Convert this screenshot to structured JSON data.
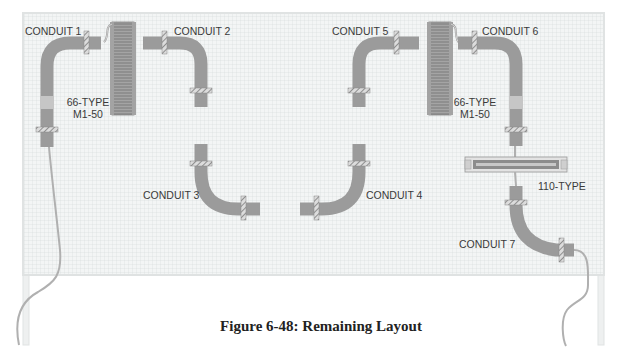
{
  "figure": {
    "caption": "Figure 6-48:  Remaining Layout"
  },
  "colors": {
    "board_fill": "#f1f3f3",
    "grid_line": "#d6dadb",
    "board_frame": "#e3e6e6",
    "conduit": "#9b9b9b",
    "conduit_sleeve": "#c4c4c4",
    "cable": "#b5b5b5",
    "block": "#8e8e8e",
    "label_text": "#3a3a3a"
  },
  "labels": {
    "conduit1": "CONDUIT 1",
    "conduit2": "CONDUIT 2",
    "conduit3": "CONDUIT 3",
    "conduit4": "CONDUIT 4",
    "conduit5": "CONDUIT 5",
    "conduit6": "CONDUIT 6",
    "conduit7": "CONDUIT 7",
    "block_left_line1": "66-TYPE",
    "block_left_line2": "M1-50",
    "block_right_line1": "66-TYPE",
    "block_right_line2": "M1-50",
    "block_110": "110-TYPE"
  }
}
